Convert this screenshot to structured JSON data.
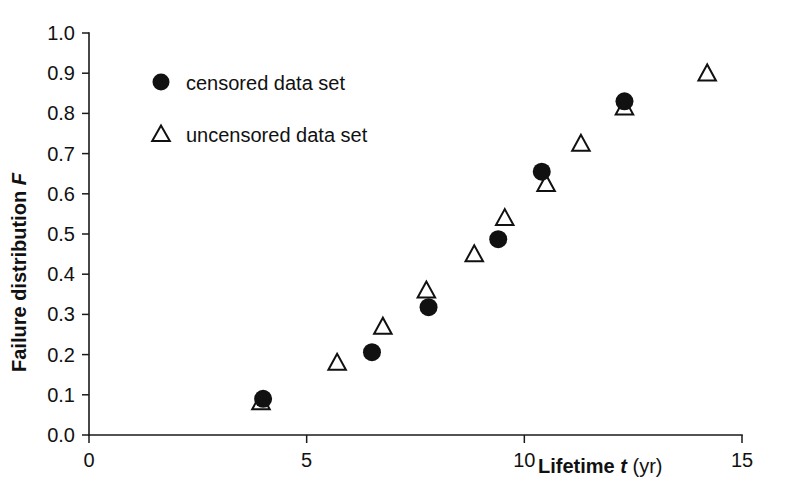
{
  "chart_data": {
    "type": "scatter",
    "title": "",
    "xlabel": "Lifetime t (yr)",
    "xlabel_parts": {
      "bold": "Lifetime",
      "symbol": "t",
      "unit": "(yr)"
    },
    "ylabel": "Failure distribution F",
    "ylabel_parts": {
      "bold": "Failure distribution",
      "symbol": "F"
    },
    "xlim": [
      0,
      15
    ],
    "ylim": [
      0.0,
      1.0
    ],
    "xticks": [
      0,
      5,
      10,
      15
    ],
    "xticklabels": [
      "0",
      "5",
      "10",
      "15"
    ],
    "yticks": [
      0.0,
      0.1,
      0.2,
      0.3,
      0.4,
      0.5,
      0.6,
      0.7,
      0.8,
      0.9,
      1.0
    ],
    "yticklabels": [
      "0.0",
      "0.1",
      "0.2",
      "0.3",
      "0.4",
      "0.5",
      "0.6",
      "0.7",
      "0.8",
      "0.9",
      "1.0"
    ],
    "grid": false,
    "legend_position": "upper-left-inside",
    "series": [
      {
        "name": "censored data set",
        "marker": "filled-circle",
        "color": "#111111",
        "points": [
          {
            "x": 4.0,
            "y": 0.09
          },
          {
            "x": 6.5,
            "y": 0.206
          },
          {
            "x": 7.8,
            "y": 0.318
          },
          {
            "x": 9.4,
            "y": 0.487
          },
          {
            "x": 10.4,
            "y": 0.655
          },
          {
            "x": 12.3,
            "y": 0.83
          }
        ]
      },
      {
        "name": "uncensored data set",
        "marker": "open-triangle",
        "color": "#111111",
        "points": [
          {
            "x": 3.95,
            "y": 0.082
          },
          {
            "x": 5.7,
            "y": 0.18
          },
          {
            "x": 6.75,
            "y": 0.27
          },
          {
            "x": 7.75,
            "y": 0.36
          },
          {
            "x": 8.85,
            "y": 0.45
          },
          {
            "x": 9.55,
            "y": 0.54
          },
          {
            "x": 10.5,
            "y": 0.625
          },
          {
            "x": 11.3,
            "y": 0.725
          },
          {
            "x": 12.3,
            "y": 0.815
          },
          {
            "x": 14.2,
            "y": 0.9
          }
        ]
      }
    ]
  },
  "legend": {
    "entries": [
      {
        "label": "censored data set",
        "marker": "filled-circle"
      },
      {
        "label": "uncensored data set",
        "marker": "open-triangle"
      }
    ]
  }
}
